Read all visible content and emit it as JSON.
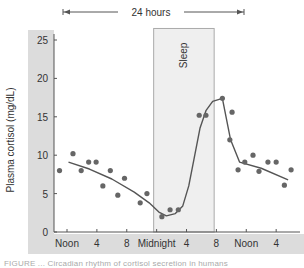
{
  "chart_data": {
    "type": "scatter",
    "title": "",
    "span_label": "24 hours",
    "ylabel": "Plasma cortisol (mg/dL)",
    "xlabel": "",
    "ylim": [
      0,
      25
    ],
    "yticks": [
      0,
      5,
      10,
      15,
      20,
      25
    ],
    "x_unit": "hours from Noon",
    "xlim": [
      -1.5,
      31
    ],
    "xticks": [
      {
        "x": 0,
        "label": "Noon"
      },
      {
        "x": 4,
        "label": "4"
      },
      {
        "x": 8,
        "label": "8"
      },
      {
        "x": 12,
        "label": "Midnight"
      },
      {
        "x": 16,
        "label": "4"
      },
      {
        "x": 20,
        "label": "8"
      },
      {
        "x": 24,
        "label": "Noon"
      },
      {
        "x": 28,
        "label": "4"
      }
    ],
    "shaded_region": {
      "label": "Sleep",
      "x_start": 11.6,
      "x_end": 19.7,
      "y_top": 26.5
    },
    "grid": false,
    "legend": null,
    "series": [
      {
        "name": "Measured cortisol",
        "type": "scatter",
        "points": [
          [
            -1.0,
            8.0
          ],
          [
            0.8,
            10.2
          ],
          [
            1.9,
            8.0
          ],
          [
            2.9,
            9.1
          ],
          [
            3.9,
            9.1
          ],
          [
            4.8,
            6.0
          ],
          [
            5.8,
            8.0
          ],
          [
            6.8,
            4.8
          ],
          [
            7.7,
            7.0
          ],
          [
            9.8,
            3.8
          ],
          [
            10.7,
            5.0
          ],
          [
            12.7,
            2.0
          ],
          [
            13.8,
            2.9
          ],
          [
            14.9,
            2.9
          ],
          [
            17.7,
            15.2
          ],
          [
            18.6,
            15.2
          ],
          [
            20.8,
            17.4
          ],
          [
            21.8,
            12.0
          ],
          [
            22.1,
            15.6
          ],
          [
            22.9,
            8.1
          ],
          [
            23.8,
            9.1
          ],
          [
            24.9,
            10.0
          ],
          [
            25.7,
            7.9
          ],
          [
            26.9,
            9.1
          ],
          [
            28.0,
            9.1
          ],
          [
            29.1,
            6.1
          ],
          [
            30.0,
            8.1
          ]
        ]
      },
      {
        "name": "Trend",
        "type": "line",
        "points": [
          [
            0.2,
            9.1
          ],
          [
            3,
            8.2
          ],
          [
            6,
            6.9
          ],
          [
            9,
            5.2
          ],
          [
            11,
            3.8
          ],
          [
            12.3,
            2.6
          ],
          [
            13.3,
            2.1
          ],
          [
            14.5,
            2.4
          ],
          [
            15.5,
            3.4
          ],
          [
            16.3,
            6
          ],
          [
            17,
            9.5
          ],
          [
            17.8,
            13.5
          ],
          [
            18.6,
            15.8
          ],
          [
            19.5,
            17
          ],
          [
            20.8,
            17.4
          ],
          [
            21.9,
            12.0
          ],
          [
            23.1,
            9.1
          ],
          [
            26,
            8.3
          ],
          [
            29.6,
            6.8
          ]
        ]
      }
    ]
  },
  "caption": "FIGURE ... Circadian rhythm of cortisol secretion in humans"
}
